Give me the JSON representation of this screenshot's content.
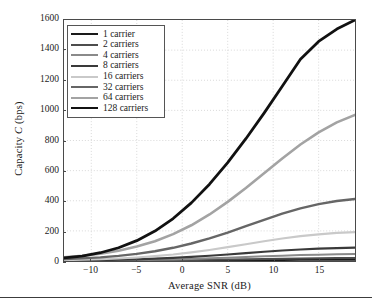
{
  "chart_data": {
    "type": "line",
    "title": "",
    "xlabel": "Average SNR (dB)",
    "ylabel": "Capacity C (bps)",
    "ylabel_plain": "Capacity",
    "ylabel_italic": "C",
    "ylabel_units": "(bps)",
    "xlim": [
      -13,
      19
    ],
    "ylim": [
      0,
      1600
    ],
    "xticks": [
      -10,
      -5,
      0,
      5,
      10,
      15
    ],
    "xtick_labels": [
      "−10",
      "−5",
      "0",
      "5",
      "10",
      "15"
    ],
    "yticks": [
      0,
      200,
      400,
      600,
      800,
      1000,
      1200,
      1400,
      1600
    ],
    "ytick_labels": [
      "0",
      "200",
      "400",
      "600",
      "800",
      "1000",
      "1200",
      "1400",
      "1600"
    ],
    "grid": true,
    "grid_style": "dotted",
    "legend_position": "upper-left",
    "x": [
      -13,
      -11,
      -9,
      -7,
      -5,
      -3,
      -1,
      1,
      3,
      5,
      7,
      9,
      11,
      13,
      15,
      17,
      19
    ],
    "series": [
      {
        "name": "1 carrier",
        "color": "#1a1a1a",
        "width": 2.0,
        "values": [
          0.3,
          0.4,
          0.6,
          0.8,
          1.1,
          1.5,
          2.0,
          2.6,
          3.3,
          4.1,
          5.0,
          5.9,
          6.8,
          7.5,
          8.1,
          8.5,
          8.8
        ]
      },
      {
        "name": "2 carriers",
        "color": "#4d4d4d",
        "width": 2.0,
        "values": [
          0.7,
          1.0,
          1.4,
          1.9,
          2.6,
          3.5,
          4.7,
          6.1,
          7.8,
          9.6,
          11.6,
          13.6,
          15.5,
          17.1,
          18.4,
          19.4,
          20.1
        ]
      },
      {
        "name": "4 carriers",
        "color": "#8a8a8a",
        "width": 2.0,
        "values": [
          1.5,
          2.1,
          3.0,
          4.2,
          5.8,
          7.9,
          10.6,
          13.9,
          17.8,
          22.1,
          26.6,
          31.2,
          35.4,
          39.1,
          42.1,
          44.3,
          45.9
        ]
      },
      {
        "name": "8 carriers",
        "color": "#3a3a3a",
        "width": 2.2,
        "values": [
          2.9,
          4.1,
          5.8,
          8.1,
          11.2,
          15.3,
          20.6,
          27.1,
          34.8,
          43.4,
          52.4,
          61.3,
          69.5,
          76.5,
          82.0,
          86.0,
          88.5
        ]
      },
      {
        "name": "16 carriers",
        "color": "#c9c9c9",
        "width": 2.2,
        "values": [
          6.0,
          8.5,
          12.0,
          16.8,
          23.3,
          31.9,
          43.0,
          56.8,
          73.2,
          91.7,
          111.4,
          131.1,
          149.4,
          165.0,
          177.3,
          186.2,
          191.9
        ]
      },
      {
        "name": "32 carriers",
        "color": "#666666",
        "width": 2.4,
        "values": [
          12.2,
          17.2,
          24.3,
          34.1,
          47.3,
          64.9,
          87.7,
          116.2,
          150.3,
          189.1,
          231.0,
          273.7,
          314.3,
          349.5,
          377.6,
          398.2,
          411.7
        ]
      },
      {
        "name": "64 carriers",
        "color": "#a3a3a3",
        "width": 2.6,
        "values": [
          24.6,
          34.7,
          49.0,
          68.8,
          95.6,
          131.4,
          178.2,
          237.2,
          309.0,
          392.5,
          485.2,
          583.1,
          681.0,
          773.2,
          854.4,
          920.6,
          970.0
        ]
      },
      {
        "name": "128 carriers",
        "color": "#111111",
        "width": 2.8,
        "values": [
          20,
          33,
          55,
          88,
          135,
          199,
          282,
          386,
          510,
          653,
          812,
          982,
          1160,
          1340,
          1458,
          1540,
          1600
        ]
      }
    ]
  },
  "legend": {
    "items": [
      {
        "label": "1 carrier"
      },
      {
        "label": "2 carriers"
      },
      {
        "label": "4 carriers"
      },
      {
        "label": "8 carriers"
      },
      {
        "label": "16 carriers"
      },
      {
        "label": "32 carriers"
      },
      {
        "label": "64 carriers"
      },
      {
        "label": "128 carriers"
      }
    ]
  },
  "colors": {
    "axis": "#4a4a4a",
    "grid": "#c8c8c8",
    "text": "#1a1a1a",
    "background": "#ffffff",
    "rule": "#3c3c3c"
  }
}
